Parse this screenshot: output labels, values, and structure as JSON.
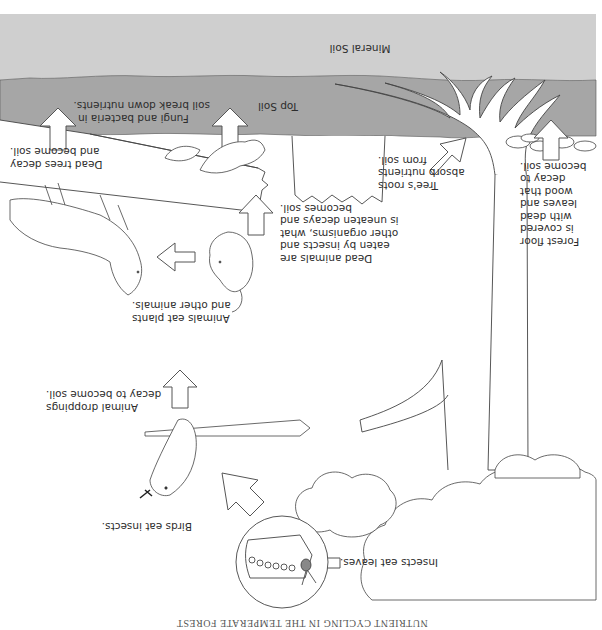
{
  "diagram": {
    "title": "NUTRIENT CYCLING IN THE TEMPERATE FOREST",
    "orientation": "rotated 180 degrees",
    "layers": {
      "mineral_soil": {
        "label": "Mineral Soil",
        "color": "#cfcfcf"
      },
      "top_soil": {
        "label": "Top Soil",
        "color": "#a6a6a6"
      }
    },
    "captions": {
      "fungi": "Fungi and bacteria in\nsoil break down nutrients.",
      "dead_trees": "Dead trees decay\nand become soil.",
      "forest_floor": "Forest floor\nis covered\nwith dead\nleaves and\nwood that\ndecay to\nbecome soil.",
      "tree_roots": "Tree's roots\nabsorb nutrients\nfrom soil.",
      "dead_animals": "Dead animals are\neaten by insects and\nother organisms, what\nis uneaten decays and\nbecomes soil.",
      "animals_eat": "Animals eat plants\nand other animals.",
      "droppings": "Animal droppings\ndecay to become soil.",
      "birds": "Birds eat insects.",
      "insects": "Insects eat leaves."
    },
    "colors": {
      "line": "#3a3a3a",
      "arrow_fill": "#ffffff",
      "background": "#ffffff"
    }
  }
}
